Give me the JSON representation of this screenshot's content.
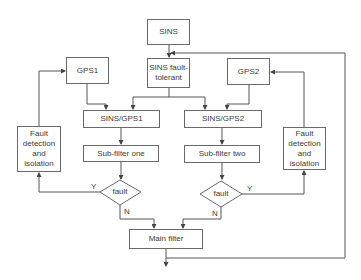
{
  "diagram": {
    "type": "flowchart",
    "nodes": {
      "sins": {
        "label": "SINS"
      },
      "sins_ft": {
        "label": "SINS fault-\ntolerant"
      },
      "gps1": {
        "label": "GPS1"
      },
      "gps2": {
        "label": "GPS2"
      },
      "sins_gps1": {
        "label": "SINS/GPS1"
      },
      "sins_gps2": {
        "label": "SINS/GPS2"
      },
      "subfilter_one": {
        "label": "Sub-filter one"
      },
      "subfilter_two": {
        "label": "Sub-filter two"
      },
      "fault_left": {
        "label": "fault"
      },
      "fault_right": {
        "label": "fault"
      },
      "fdi_left": {
        "label": "Fault\ndetection\nand\nisolation"
      },
      "fdi_right": {
        "label": "Fault\ndetection\nand\nisolation"
      },
      "main_filter": {
        "label": "Main filter"
      }
    },
    "edge_labels": {
      "left_yes": "Y",
      "left_no": "N",
      "right_yes": "Y",
      "right_no": "N"
    },
    "colors": {
      "line": "#555555",
      "border": "#6a6a6a",
      "text": "#3a3a3a",
      "background": "#ffffff"
    }
  }
}
